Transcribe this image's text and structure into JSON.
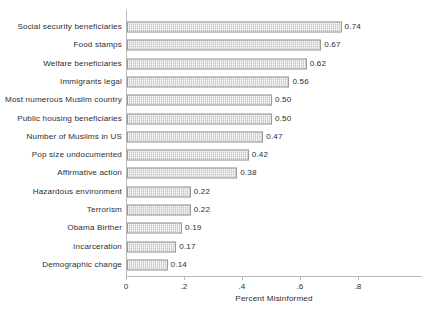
{
  "chart_data": {
    "type": "bar",
    "orientation": "horizontal",
    "title": "",
    "xlabel": "Percent Misinformed",
    "ylabel": "",
    "xlim": [
      0,
      1.0
    ],
    "xticks": [
      "0",
      ".2",
      ".4",
      ".6",
      ".8"
    ],
    "xtick_values": [
      0,
      0.2,
      0.4,
      0.6,
      0.8
    ],
    "grid": false,
    "legend": null,
    "bar_color": "#dddddd",
    "bar_border_color": "#9a9a9a",
    "axis_color": "#b9b9b9",
    "text_color": "#2e2e2e",
    "categories": [
      "Social security beneficiaries",
      "Food stamps",
      "Welfare beneficiaries",
      "Immigrants legal",
      "Most numerous Muslim country",
      "Public housing beneficiaries",
      "Number of Muslims in US",
      "Pop size undocumented",
      "Affirmative action",
      "Hazardous environment",
      "Terrorism",
      "Obama Birther",
      "Incarceration",
      "Demographic change"
    ],
    "values": [
      0.74,
      0.67,
      0.62,
      0.56,
      0.5,
      0.5,
      0.47,
      0.42,
      0.38,
      0.22,
      0.22,
      0.19,
      0.17,
      0.14
    ],
    "value_labels": [
      "0.74",
      "0.67",
      "0.62",
      "0.56",
      "0.50",
      "0.50",
      "0.47",
      "0.42",
      "0.38",
      "0.22",
      "0.22",
      "0.19",
      "0.17",
      "0.14"
    ]
  }
}
